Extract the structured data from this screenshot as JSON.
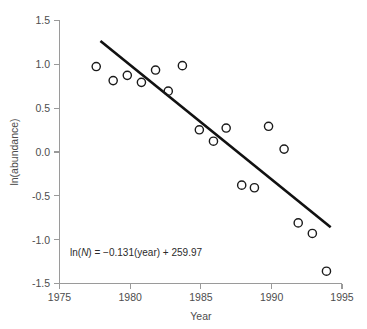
{
  "chart_data": {
    "type": "scatter",
    "title": "",
    "xlabel": "Year",
    "ylabel": "ln(abundance)",
    "xlim": [
      1975,
      1995
    ],
    "ylim": [
      -1.5,
      1.5
    ],
    "xticks": [
      "1975",
      "1980",
      "1985",
      "1990",
      "1995"
    ],
    "xtick_values": [
      1975,
      1980,
      1985,
      1990,
      1995
    ],
    "yticks": [
      "1.5",
      "1.0",
      "0.5",
      "0.0",
      "-0.5",
      "-1.0",
      "-1.5"
    ],
    "ytick_values": [
      1.5,
      1.0,
      0.5,
      0.0,
      -0.5,
      -1.0,
      -1.5
    ],
    "grid": false,
    "legend": null,
    "marker": "open-circle",
    "marker_color": "#1a1a1a",
    "points": [
      {
        "x": 1977.6,
        "y": 0.97
      },
      {
        "x": 1978.8,
        "y": 0.81
      },
      {
        "x": 1979.8,
        "y": 0.87
      },
      {
        "x": 1980.8,
        "y": 0.79
      },
      {
        "x": 1981.8,
        "y": 0.93
      },
      {
        "x": 1982.7,
        "y": 0.69
      },
      {
        "x": 1983.7,
        "y": 0.98
      },
      {
        "x": 1984.9,
        "y": 0.25
      },
      {
        "x": 1985.9,
        "y": 0.12
      },
      {
        "x": 1986.8,
        "y": 0.27
      },
      {
        "x": 1987.9,
        "y": -0.38
      },
      {
        "x": 1988.8,
        "y": -0.41
      },
      {
        "x": 1989.8,
        "y": 0.29
      },
      {
        "x": 1990.9,
        "y": 0.03
      },
      {
        "x": 1991.9,
        "y": -0.81
      },
      {
        "x": 1992.9,
        "y": -0.93
      },
      {
        "x": 1993.9,
        "y": -1.36
      }
    ],
    "fit_line": {
      "equation_prefix": "ln(",
      "equation_var": "N",
      "equation_suffix": ") = −0.131(year) + 259.97",
      "slope": -0.131,
      "intercept": 259.97,
      "x_start": 1977.9,
      "x_end": 1994.2,
      "y_start": 1.26,
      "y_end": -0.86,
      "color": "#111111"
    },
    "annotation": {
      "text": "ln(N) = −0.131(year) + 259.97",
      "x": 1979.2,
      "y": -1.16
    },
    "axis_color": "#9a9a9a",
    "text_color": "#4d4d4d"
  }
}
